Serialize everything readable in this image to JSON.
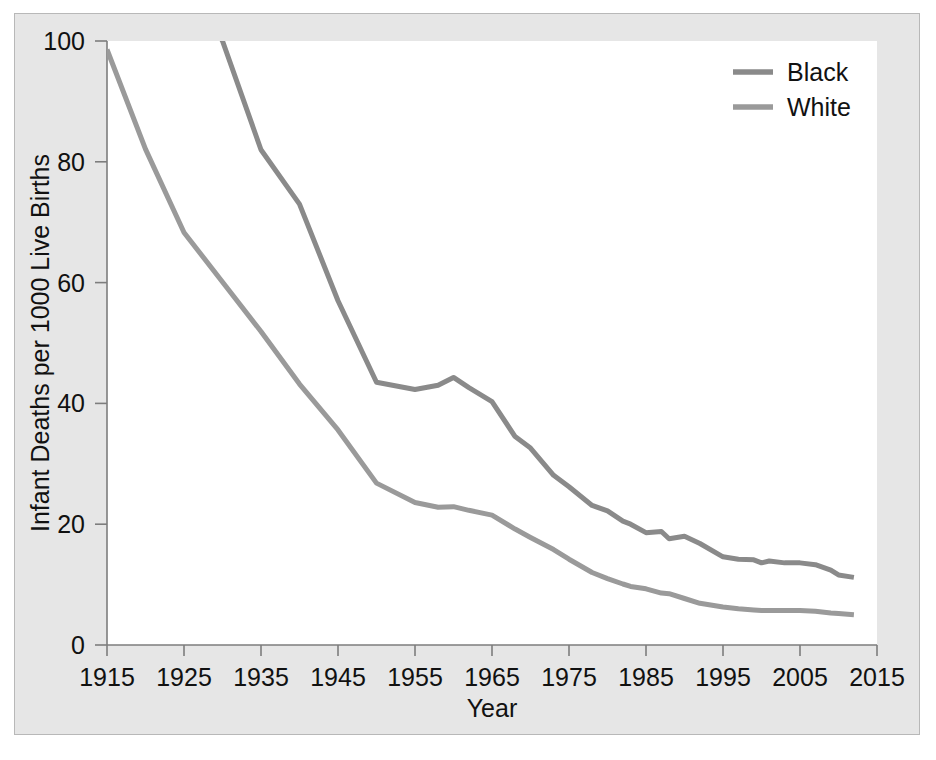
{
  "figure": {
    "background_color": "#e6e6e6",
    "plot_background_color": "#ffffff",
    "border_color": "#b8b8b8",
    "axis_color": "#7d7d7d"
  },
  "chart_data": {
    "type": "line",
    "title": "",
    "xlabel": "Year",
    "ylabel": "Infant Deaths per 1000 Live Births",
    "xlim": [
      1915,
      2015
    ],
    "ylim": [
      0,
      100
    ],
    "xticks": [
      1915,
      1925,
      1935,
      1945,
      1955,
      1965,
      1975,
      1985,
      1995,
      2005,
      2015
    ],
    "xtick_labels": [
      "1915",
      "1925",
      "1935",
      "1945",
      "1955",
      "1965",
      "1975",
      "1985",
      "1995",
      "2005",
      "2015"
    ],
    "yticks": [
      0,
      20,
      40,
      60,
      80,
      100
    ],
    "ytick_labels": [
      "0",
      "20",
      "40",
      "60",
      "80",
      "100"
    ],
    "grid": false,
    "legend_position": "top-right",
    "x": [
      1915,
      1920,
      1925,
      1930,
      1935,
      1940,
      1945,
      1950,
      1955,
      1958,
      1960,
      1962,
      1965,
      1968,
      1970,
      1973,
      1975,
      1978,
      1980,
      1982,
      1983,
      1985,
      1987,
      1988,
      1990,
      1992,
      1995,
      1997,
      1999,
      2000,
      2001,
      2003,
      2005,
      2007,
      2009,
      2010,
      2012
    ],
    "series": [
      {
        "name": "Black",
        "color": "#8a8a8a",
        "values": [
          181,
          141,
          111,
          100,
          82,
          73,
          57,
          43.5,
          42.3,
          43.0,
          44.3,
          42.6,
          40.3,
          34.5,
          32.6,
          28.1,
          26.2,
          23.1,
          22.2,
          20.5,
          20.0,
          18.6,
          18.8,
          17.6,
          18.0,
          16.8,
          14.6,
          14.2,
          14.1,
          13.6,
          13.9,
          13.6,
          13.6,
          13.3,
          12.4,
          11.6,
          11.2
        ]
      },
      {
        "name": "White",
        "color": "#9a9a9a",
        "values": [
          98.6,
          82.1,
          68.3,
          60.1,
          51.9,
          43.2,
          35.6,
          26.8,
          23.6,
          22.8,
          22.9,
          22.3,
          21.5,
          19.2,
          17.8,
          15.8,
          14.2,
          12.0,
          11.0,
          10.1,
          9.7,
          9.3,
          8.6,
          8.5,
          7.7,
          6.9,
          6.3,
          6.0,
          5.8,
          5.7,
          5.7,
          5.7,
          5.7,
          5.6,
          5.3,
          5.2,
          5.0
        ]
      }
    ],
    "legend": [
      {
        "label": "Black",
        "color": "#8a8a8a"
      },
      {
        "label": "White",
        "color": "#9a9a9a"
      }
    ]
  }
}
